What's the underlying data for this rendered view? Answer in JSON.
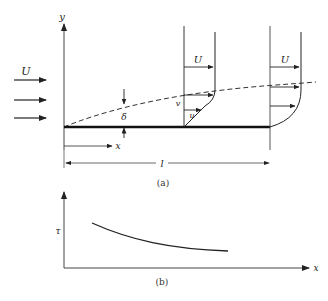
{
  "figure_a": {
    "caption": "(a)",
    "labels": {
      "y_axis": "y",
      "x_axis": "x",
      "freestream": "U",
      "boundary_layer_thickness": "δ",
      "plate_length": "l",
      "profile1_U": "U",
      "profile1_v": "v",
      "profile1_u": "u",
      "profile2_U": "U"
    },
    "description": "Flow over a flat plate with growing boundary layer (dashed) and velocity profiles"
  },
  "figure_b": {
    "caption": "(b)",
    "labels": {
      "y_axis": "τ",
      "x_axis": "x"
    }
  },
  "colors": {
    "ink": "#222222",
    "background": "#ffffff"
  }
}
